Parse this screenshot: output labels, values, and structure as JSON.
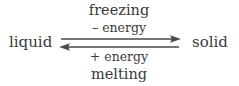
{
  "diagram": {
    "type": "phase-change-equilibrium",
    "left_state": "liquid",
    "right_state": "solid",
    "forward": {
      "process": "freezing",
      "energy": "– energy",
      "direction": "left-to-right"
    },
    "reverse": {
      "process": "melting",
      "energy": "+ energy",
      "direction": "right-to-left"
    },
    "colors": {
      "text": "#3a3a3a",
      "arrow": "#4a4a4a",
      "background": "#ffffff"
    }
  }
}
